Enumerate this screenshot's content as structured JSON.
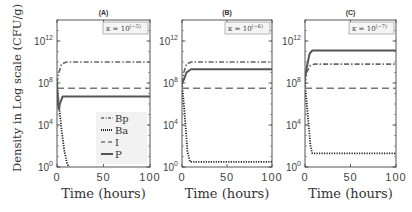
{
  "figure": {
    "ylabel": "Density in Log scale (CFU/g)",
    "xlabel": "Time (hours)"
  },
  "chart_data": [
    {
      "type": "line",
      "title": "(A)",
      "annotation": "κ = 10^(−5)",
      "annotation_base": "κ = 10",
      "annotation_exp": "(−5)",
      "xlabel": "Time (hours)",
      "ylabel": "Density in Log scale (CFU/g)",
      "xlim": [
        0,
        100
      ],
      "ylim_log10": [
        0,
        14
      ],
      "xticks": [
        "0",
        "50",
        "100"
      ],
      "yticks": [
        {
          "base": "10",
          "exp": "0"
        },
        {
          "base": "10",
          "exp": "4"
        },
        {
          "base": "10",
          "exp": "8"
        },
        {
          "base": "10",
          "exp": "12"
        }
      ],
      "legend": {
        "position": "lower right",
        "entries": [
          "Bp",
          "Ba",
          "I",
          "P"
        ]
      },
      "series": [
        {
          "name": "Bp",
          "style": "dash-dot",
          "x": [
            0,
            2,
            5,
            10,
            100
          ],
          "log10_y": [
            8,
            9,
            9.8,
            10,
            10
          ]
        },
        {
          "name": "Ba",
          "style": "dotted",
          "x": [
            0,
            2,
            5,
            8,
            11,
            13
          ],
          "log10_y": [
            8,
            6,
            3.5,
            1.5,
            0.3,
            0
          ]
        },
        {
          "name": "I",
          "style": "dashed",
          "x": [
            0,
            100
          ],
          "log10_y": [
            7.5,
            7.5
          ]
        },
        {
          "name": "P",
          "style": "solid",
          "x": [
            0,
            1,
            2,
            3,
            6,
            10,
            100
          ],
          "log10_y": [
            8,
            6,
            5.5,
            6,
            6.7,
            6.7,
            6.7
          ]
        }
      ]
    },
    {
      "type": "line",
      "title": "(B)",
      "annotation": "κ = 10^(−6)",
      "annotation_base": "κ = 10",
      "annotation_exp": "(−6)",
      "xlabel": "Time (hours)",
      "xlim": [
        0,
        100
      ],
      "ylim_log10": [
        0,
        14
      ],
      "xticks": [
        "0",
        "50",
        "100"
      ],
      "yticks": [
        {
          "base": "10",
          "exp": "0"
        },
        {
          "base": "10",
          "exp": "4"
        },
        {
          "base": "10",
          "exp": "8"
        },
        {
          "base": "10",
          "exp": "12"
        }
      ],
      "series": [
        {
          "name": "Bp",
          "style": "dash-dot",
          "x": [
            0,
            2,
            5,
            10,
            100
          ],
          "log10_y": [
            8,
            9,
            9.8,
            10,
            10
          ]
        },
        {
          "name": "Ba",
          "style": "dotted",
          "x": [
            0,
            3,
            6,
            9,
            100
          ],
          "log10_y": [
            8,
            5,
            1.5,
            0.5,
            0.5
          ]
        },
        {
          "name": "I",
          "style": "dashed",
          "x": [
            0,
            100
          ],
          "log10_y": [
            7.5,
            7.5
          ]
        },
        {
          "name": "P",
          "style": "solid",
          "x": [
            0,
            2,
            5,
            10,
            100
          ],
          "log10_y": [
            8,
            8.3,
            9,
            9.3,
            9.3
          ]
        }
      ]
    },
    {
      "type": "line",
      "title": "(C)",
      "annotation": "κ = 10^(−7)",
      "annotation_base": "κ = 10",
      "annotation_exp": "(−7)",
      "xlabel": "Time (hours)",
      "xlim": [
        0,
        100
      ],
      "ylim_log10": [
        0,
        14
      ],
      "xticks": [
        "0",
        "50",
        "100"
      ],
      "yticks": [
        {
          "base": "10",
          "exp": "0"
        },
        {
          "base": "10",
          "exp": "4"
        },
        {
          "base": "10",
          "exp": "8"
        },
        {
          "base": "10",
          "exp": "12"
        }
      ],
      "series": [
        {
          "name": "Bp",
          "style": "dash-dot",
          "x": [
            0,
            2,
            5,
            10,
            100
          ],
          "log10_y": [
            8,
            9,
            9.6,
            9.8,
            9.8
          ]
        },
        {
          "name": "Ba",
          "style": "dotted",
          "x": [
            0,
            3,
            6,
            8,
            100
          ],
          "log10_y": [
            8,
            5,
            2,
            1.3,
            1.3
          ]
        },
        {
          "name": "I",
          "style": "dashed",
          "x": [
            0,
            100
          ],
          "log10_y": [
            7.5,
            7.5
          ]
        },
        {
          "name": "P",
          "style": "solid",
          "x": [
            0,
            2,
            5,
            8,
            100
          ],
          "log10_y": [
            8.5,
            9.5,
            10.8,
            11.1,
            11.1
          ]
        }
      ]
    }
  ]
}
